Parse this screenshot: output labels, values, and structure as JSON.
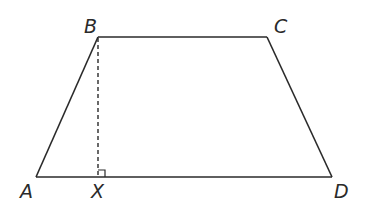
{
  "diagram": {
    "type": "trapezium",
    "vertices": {
      "A": {
        "label": "A",
        "x": 36,
        "y": 177,
        "label_x": 20,
        "label_y": 198
      },
      "B": {
        "label": "B",
        "x": 98,
        "y": 37,
        "label_x": 84,
        "label_y": 33
      },
      "C": {
        "label": "C",
        "x": 267,
        "y": 37,
        "label_x": 274,
        "label_y": 33
      },
      "D": {
        "label": "D",
        "x": 332,
        "y": 177,
        "label_x": 334,
        "label_y": 198
      },
      "X": {
        "label": "X",
        "x": 98,
        "y": 177,
        "label_x": 91,
        "label_y": 198
      }
    },
    "edges": [
      {
        "from": "A",
        "to": "B",
        "style": "solid"
      },
      {
        "from": "B",
        "to": "C",
        "style": "solid"
      },
      {
        "from": "C",
        "to": "D",
        "style": "solid"
      },
      {
        "from": "D",
        "to": "A",
        "style": "solid"
      },
      {
        "from": "B",
        "to": "X",
        "style": "dashed"
      }
    ],
    "right_angle_at": "X",
    "colors": {
      "stroke": "#2a2a2a",
      "background": "#ffffff"
    }
  }
}
